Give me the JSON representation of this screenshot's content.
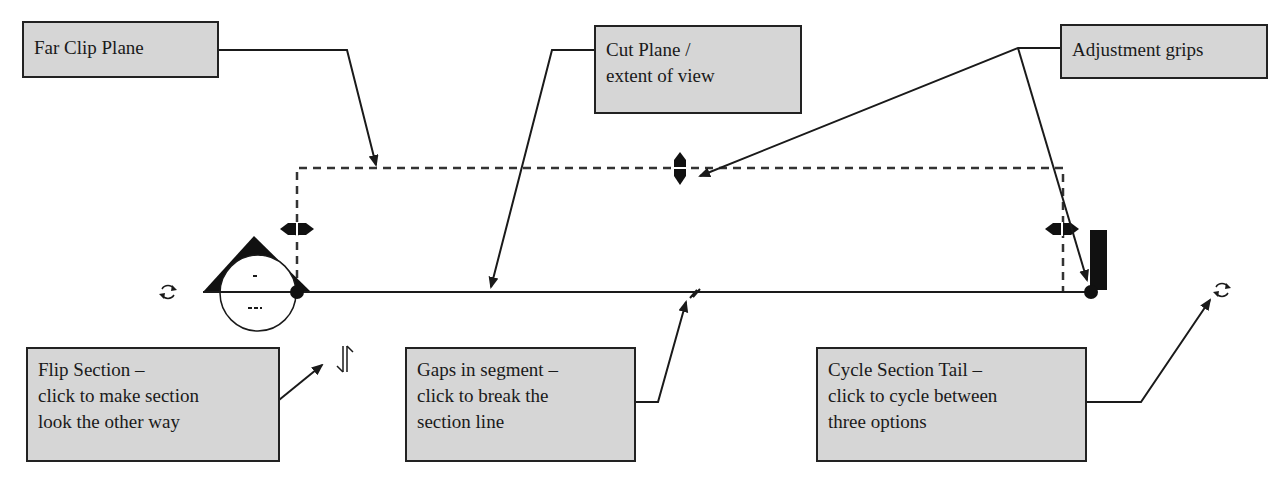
{
  "diagram": {
    "callouts": {
      "far_clip": {
        "lines": [
          "Far Clip Plane"
        ]
      },
      "cut_plane": {
        "lines": [
          "Cut Plane /",
          "extent of view"
        ]
      },
      "grips": {
        "lines": [
          "Adjustment grips"
        ]
      },
      "flip": {
        "lines": [
          "Flip Section –",
          "click to make section",
          "look the other way"
        ]
      },
      "gaps": {
        "lines": [
          "Gaps in segment –",
          "click to break the",
          "section line"
        ]
      },
      "cycle": {
        "lines": [
          "Cycle Section Tail –",
          "click to cycle between",
          "three options"
        ]
      }
    },
    "icons": {
      "cycle_left": "cycle-arrows-icon",
      "cycle_right": "cycle-arrows-icon",
      "flip": "flip-arrows-icon",
      "gap": "segment-gap-icon"
    },
    "colors": {
      "callout_fill": "#d6d6d6",
      "stroke": "#1a1a1a",
      "background": "#ffffff"
    }
  }
}
